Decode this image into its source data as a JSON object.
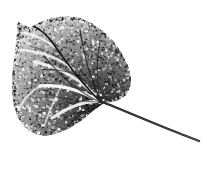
{
  "image": {
    "kind": "natural-image",
    "subject": "leaf-specimen-print",
    "title": "Leaf specimen print",
    "width": 207,
    "height": 175,
    "background_color": "#ffffff",
    "rendering": "grainy stippled black-and-white scan, no text or UI chrome",
    "caption": ""
  },
  "palette": {
    "background": "#ffffff",
    "ink_darkest": "#111111",
    "ink_dark": "#2e2e2e",
    "ink_mid": "#5f5f5f",
    "ink_light": "#9a9a9a",
    "ink_faint": "#c8c8c8",
    "vein_highlight": "#ffffff",
    "stem_color": "#1a1a1a"
  },
  "leaf": {
    "name": "leaf-blade",
    "shape": "deltoid",
    "bounds": {
      "x": 12,
      "y": 16,
      "width": 120,
      "height": 120
    },
    "apex_point": {
      "x": 18,
      "y": 22
    },
    "base_point": {
      "x": 101,
      "y": 102
    },
    "outline_path": "M 18 22 L 30 28 L 40 22 L 52 18 L 66 16 L 80 18 L 93 24 L 104 32 L 114 42 L 122 54 L 128 66 L 131 78 L 130 88 L 125 96 L 116 101 L 104 103 L 94 110 L 82 120 L 70 128 L 58 133 L 46 136 L 35 134 L 26 128 L 18 118 L 14 106 L 12 92 L 12 76 L 14 60 L 16 44 L 17 32 Z",
    "texture_density": "high",
    "grain_seed": 20241,
    "grain_dots": 2600
  },
  "veins": {
    "name": "vein-network",
    "midrib": "M 101 102 C 86 88, 66 62, 52 42 C 44 31, 34 24, 19 22",
    "white_channels": [
      "M 101 102 C 84 92, 62 84, 40 86",
      "M 101 102 C 88 100, 70 106, 52 118",
      "M 95 95 C 78 78, 58 66, 34 62",
      "M 74 70 C 62 60, 46 52, 22 50",
      "M 56 48 C 46 40, 34 34, 20 32",
      "M 40 86 C 30 92, 22 100, 18 112",
      "M 62 84 C 56 96, 50 110, 44 126"
    ],
    "dark_secondaries": [
      "M 101 102 C 92 82, 84 58, 80 30",
      "M 101 102 C 96 86, 96 62, 100 40",
      "M 101 102 C 104 88, 112 70, 122 56",
      "M 101 102 C 104 94, 114 86, 126 82",
      "M 101 102 C 92 104, 80 114, 68 126",
      "M 101 102 C 86 102, 68 100, 46 94",
      "M 101 102 C 84 96, 62 78, 44 56",
      "M 68 64 C 58 56, 46 50, 30 46",
      "M 84 80 C 74 72, 58 68, 38 70"
    ]
  },
  "petiole": {
    "name": "leaf-stem",
    "path": "M 100 101 C 118 108, 150 122, 176 132 C 186 136, 194 139, 199 141",
    "start_point": {
      "x": 100,
      "y": 101
    },
    "end_point": {
      "x": 199,
      "y": 141
    },
    "thickness_base": 2.4,
    "thickness_tip": 1.0,
    "color": "#1a1a1a"
  }
}
